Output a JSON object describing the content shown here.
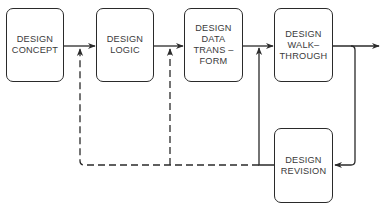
{
  "diagram": {
    "type": "flowchart",
    "boxes": [
      {
        "id": "concept",
        "label": "DESIGN\nCONCEPT"
      },
      {
        "id": "logic",
        "label": "DESIGN\nLOGIC"
      },
      {
        "id": "transform",
        "label": "DESIGN\nDATA\nTRANS –\nFORM"
      },
      {
        "id": "walkthrough",
        "label": "DESIGN\nWALK–\nTHROUGH"
      },
      {
        "id": "revision",
        "label": "DESIGN\nREVISION"
      }
    ],
    "edges": [
      {
        "from": "concept",
        "to": "logic",
        "style": "solid"
      },
      {
        "from": "logic",
        "to": "transform",
        "style": "solid"
      },
      {
        "from": "transform",
        "to": "walkthrough",
        "style": "solid"
      },
      {
        "from": "walkthrough",
        "to": "output",
        "style": "solid"
      },
      {
        "from": "walkthrough",
        "to": "revision",
        "style": "solid"
      },
      {
        "from": "revision",
        "to": "walkthrough-input",
        "style": "solid"
      },
      {
        "from": "revision",
        "to": "logic-input",
        "style": "dashed"
      },
      {
        "from": "revision",
        "to": "transform-input",
        "style": "dashed"
      }
    ],
    "colors": {
      "line": "#2a2a2a",
      "text": "#3a3a3a",
      "background": "#ffffff"
    }
  }
}
